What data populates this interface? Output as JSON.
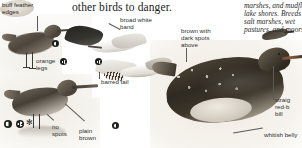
{
  "page": {
    "heading": "other birds to danger.",
    "body_text_lines": [
      "marshes, and mudfl",
      "lake shores. Breeds",
      "salt marshes, wet",
      "pastures, and moors"
    ]
  },
  "labels": {
    "buff_feather_edges": "buff feather\nedges",
    "buff_feather_edges_line1": "buff feather",
    "buff_feather_edges_line2": "edges",
    "orange_legs_line1": "orange",
    "orange_legs_line2": "legs",
    "broad_white_band_line1": "broad white",
    "broad_white_band_line2": "band",
    "barred_tail": "barred tail",
    "no_spots_line1": "no",
    "no_spots_line2": "spots",
    "plain_brown_line1": "plain",
    "plain_brown_line2": "brown",
    "brown_with_dark_spots_line1": "brown with",
    "brown_with_dark_spots_line2": "dark spots",
    "brown_with_dark_spots_line3": "above",
    "straight_red_based_bill_line1": "straig",
    "straight_red_based_bill_line2": "red-b",
    "straight_red_based_bill_line3": "bill",
    "whitish_belly": "whitish belly"
  },
  "symbols": [
    {
      "name": "juvenile-plumage-symbol",
      "kind": "pie"
    },
    {
      "name": "adult-plumage-symbol",
      "kind": "pie"
    },
    {
      "name": "seasonal-symbol",
      "kind": "star"
    },
    {
      "name": "flight-plumage-symbol",
      "kind": "pie"
    },
    {
      "name": "flight-underside-symbol",
      "kind": "pie"
    }
  ],
  "colors": {
    "page_background": "#ffffff",
    "text": "#2d2d2d",
    "heading": "#1a1a1a",
    "leader_line": "#5a5a5a",
    "plumage_dark": "#2f2a22",
    "plumage_mid": "#514738",
    "plumage_light": "#cfc8bc",
    "bill_red_base": "#8a5c3c",
    "symbol_ink": "#1d1d1b"
  }
}
